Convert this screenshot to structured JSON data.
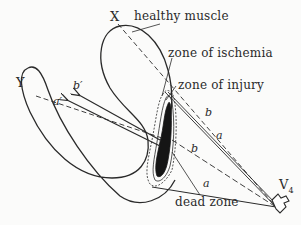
{
  "diagram": {
    "type": "anatomical-schematic",
    "colors": {
      "stroke": "#2a2a2a",
      "dead_zone_fill": "#151515",
      "background": "#fbfbfa"
    },
    "points": {
      "x": "X",
      "y": "Y",
      "electrode_main": "V",
      "electrode_sub": "4"
    },
    "zone_labels": {
      "healthy_muscle": "healthy muscle",
      "ischemia": "zone of ischemia",
      "injury": "zone of injury",
      "dead": "dead zone"
    },
    "line_labels": {
      "b_upper": "b",
      "a_upper": "a",
      "b_middle": "b",
      "a_lower": "a",
      "a_prime": "a′",
      "b_prime": "b′"
    }
  }
}
